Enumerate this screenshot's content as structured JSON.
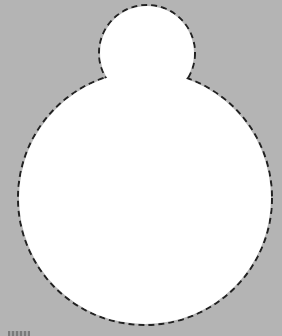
{
  "colors": {
    "background": "#b4b4b4",
    "fill": "#ffffff",
    "outline": "#222222"
  },
  "shape": {
    "description": "snowman-like silhouette with dashed outline",
    "head": {
      "cx": 147,
      "cy": 53,
      "r": 48
    },
    "body": {
      "cx": 145,
      "cy": 198,
      "r": 127
    }
  }
}
